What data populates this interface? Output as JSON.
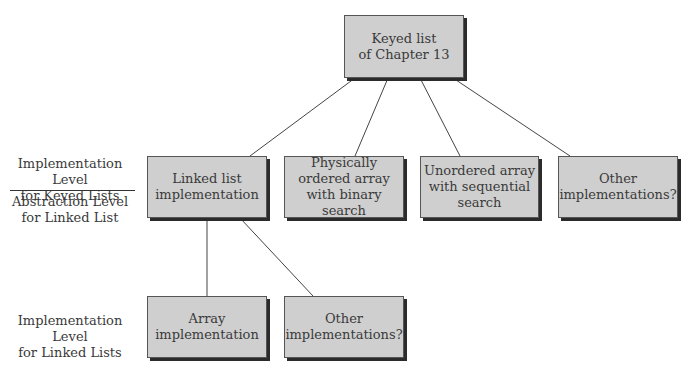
{
  "nodes": {
    "root": "Keyed list\nof Chapter 13",
    "linked": "Linked list\nimplementation",
    "ordered": "Physically\nordered array\nwith binary search",
    "unordered": "Unordered array\nwith sequential\nsearch",
    "other1": "Other\nimplementations?",
    "array": "Array\nimplementation",
    "other2": "Other\nimplementations?"
  },
  "labels": {
    "impl_keyed": "Implementation Level\nfor Keyed Lists",
    "abs_linked": "Abstraction Level\nfor Linked List",
    "impl_linked": "Implementation Level\nfor Linked Lists"
  },
  "colors": {
    "box": "#cfcfcf",
    "shadow": "#2b2b2b",
    "line": "#444444"
  }
}
